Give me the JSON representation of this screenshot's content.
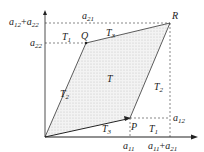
{
  "diagram": {
    "colors": {
      "axis": "#222222",
      "dash": "#555555",
      "edge": "#333333",
      "fill": "#d8d8d8"
    },
    "points": {
      "O": {
        "x": 45,
        "y": 137
      },
      "P": {
        "x": 130,
        "y": 118,
        "label": "P"
      },
      "Q": {
        "x": 86,
        "y": 43,
        "label": "Q"
      },
      "R": {
        "x": 170,
        "y": 23,
        "label": "R"
      }
    },
    "regions": {
      "T": "T",
      "T1": {
        "base": "T",
        "sub": "1"
      },
      "T2": {
        "base": "T",
        "sub": "2"
      },
      "T3": {
        "base": "T",
        "sub": "3"
      }
    },
    "y_labels": {
      "top": {
        "a": "a",
        "s1": "12",
        "plus": "+",
        "b": "a",
        "s2": "22"
      },
      "mid": {
        "a": "a",
        "s": "22"
      }
    },
    "x_labels": {
      "a11": {
        "a": "a",
        "s": "11"
      },
      "sum": {
        "a": "a",
        "s1": "11",
        "plus": "+",
        "b": "a",
        "s2": "21"
      }
    },
    "edge_labels": {
      "top": {
        "a": "a",
        "s": "21"
      },
      "right": {
        "a": "a",
        "s": "12"
      }
    }
  }
}
